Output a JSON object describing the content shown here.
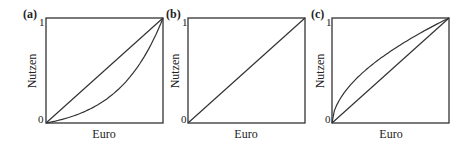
{
  "chart_data": [
    {
      "type": "line",
      "panel_label": "(a)",
      "xlabel": "Euro",
      "ylabel": "Nutzen",
      "y_ticks": [
        "0",
        "1"
      ],
      "xlim": [
        0,
        1
      ],
      "ylim": [
        0,
        1
      ],
      "series": [
        {
          "name": "linear",
          "x": [
            0,
            1
          ],
          "values": [
            0,
            1
          ]
        },
        {
          "name": "convex",
          "x": [
            0,
            0.25,
            0.5,
            0.75,
            0.9,
            1
          ],
          "values": [
            0,
            0.11,
            0.26,
            0.48,
            0.72,
            1
          ]
        }
      ]
    },
    {
      "type": "line",
      "panel_label": "(b)",
      "xlabel": "Euro",
      "ylabel": "Nutzen",
      "y_ticks": [
        "0",
        "1"
      ],
      "xlim": [
        0,
        1
      ],
      "ylim": [
        0,
        1
      ],
      "series": [
        {
          "name": "linear",
          "x": [
            0,
            1
          ],
          "values": [
            0,
            1
          ]
        }
      ]
    },
    {
      "type": "line",
      "panel_label": "(c)",
      "xlabel": "Euro",
      "ylabel": "Nutzen",
      "y_ticks": [
        "0",
        "1"
      ],
      "xlim": [
        0,
        1
      ],
      "ylim": [
        0,
        1
      ],
      "series": [
        {
          "name": "linear",
          "x": [
            0,
            1
          ],
          "values": [
            0,
            1
          ]
        },
        {
          "name": "concave",
          "x": [
            0,
            0.1,
            0.25,
            0.5,
            0.75,
            1
          ],
          "values": [
            0,
            0.23,
            0.47,
            0.69,
            0.84,
            1
          ]
        }
      ]
    }
  ],
  "colors": {
    "line": "#333333",
    "frame": "#333333",
    "text": "#222222"
  }
}
